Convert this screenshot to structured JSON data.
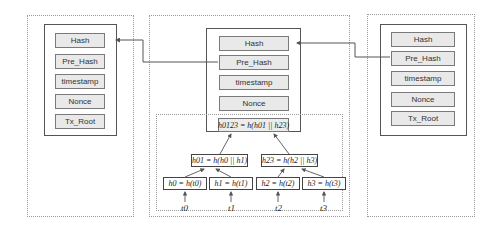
{
  "blocks": [
    {
      "name": "previous-block",
      "fields": [
        "Hash",
        "Pre_Hash",
        "timestamp",
        "Nonce",
        "Tx_Root"
      ]
    },
    {
      "name": "current-block",
      "fields": [
        "Hash",
        "Pre_Hash",
        "timestamp",
        "Nonce"
      ]
    },
    {
      "name": "next-block",
      "fields": [
        "Hash",
        "Pre_Hash",
        "timestamp",
        "Nonce",
        "Tx_Root"
      ]
    }
  ],
  "merkle_tree": {
    "root": "h0123 = h(h01 || h23)",
    "level1": [
      "h01 = h(h0 || h1)",
      "h23 = h(h2 || h3)"
    ],
    "leaves": [
      "h0 = h(t0)",
      "h1 = h(t1)",
      "h2 = h(t2)",
      "h3 = h(t3)"
    ],
    "transactions": [
      "t0",
      "t1",
      "t2",
      "t3"
    ]
  },
  "colors": {
    "line": "#555555",
    "field_bg": "#e9e9e9",
    "dotted_border": "#9a9a9a"
  }
}
